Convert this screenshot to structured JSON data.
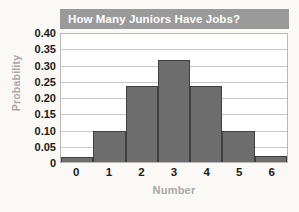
{
  "chart_data": {
    "type": "bar",
    "title": "How Many Juniors Have Jobs?",
    "xlabel": "Number",
    "ylabel": "Probability",
    "categories": [
      "0",
      "1",
      "2",
      "3",
      "4",
      "5",
      "6"
    ],
    "values": [
      0.016,
      0.094,
      0.235,
      0.315,
      0.235,
      0.095,
      0.02
    ],
    "ylim": [
      0,
      0.4
    ],
    "ytick_labels": [
      "0.40",
      "0.35",
      "0.30",
      "0.25",
      "0.20",
      "0.15",
      "0.10",
      "0.05",
      "0"
    ],
    "ytick_values": [
      0.4,
      0.35,
      0.3,
      0.25,
      0.2,
      0.15,
      0.1,
      0.05,
      0
    ],
    "grid": true,
    "legend": false,
    "bar_style": "contiguous-histogram",
    "colors": {
      "bar_fill": "#6e6e6e",
      "bar_edge": "#3f3f3f",
      "title_banner": "#9a9a9a",
      "title_text": "#ffffff",
      "axis_label": "#a8a8a8",
      "tick_label": "#1a1a1a",
      "gridline": "#c9c9c9",
      "plot_background": "#ffffff",
      "page_background": "#faf9f5"
    }
  }
}
